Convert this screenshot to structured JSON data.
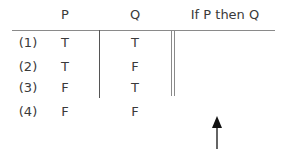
{
  "table": {
    "headers": [
      "P",
      "Q",
      "If P then Q"
    ],
    "rows": [
      {
        "label": "(1)",
        "P": "T",
        "Q": "T",
        "result": ""
      },
      {
        "label": "(2)",
        "P": "T",
        "Q": "F",
        "result": ""
      },
      {
        "label": "(3)",
        "P": "F",
        "Q": "T",
        "result": ""
      },
      {
        "label": "(4)",
        "P": "F",
        "Q": "F",
        "result": ""
      }
    ]
  },
  "annotation": {
    "arrow": "up-arrow"
  }
}
